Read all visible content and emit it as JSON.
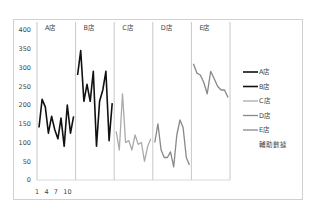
{
  "chart_data": {
    "type": "line",
    "title": "",
    "xlabel": "",
    "ylabel": "",
    "ylim": [
      0,
      400
    ],
    "yticks": [
      0,
      50,
      100,
      150,
      200,
      250,
      300,
      350,
      400
    ],
    "xtick_labels": [
      "1",
      "4",
      "7",
      "10"
    ],
    "panel_labels": [
      "A店",
      "B店",
      "C店",
      "D店",
      "E店"
    ],
    "grid": false,
    "legend_position": "right",
    "legend": [
      "A店",
      "B店",
      "C店",
      "D店",
      "E店",
      "輔助數據"
    ],
    "series": [
      {
        "name": "A店",
        "color": "#111111",
        "width": 1.6,
        "values": [
          140,
          215,
          195,
          125,
          170,
          135,
          110,
          165,
          90,
          200,
          125,
          170
        ]
      },
      {
        "name": "B店",
        "color": "#111111",
        "width": 1.6,
        "values": [
          280,
          345,
          210,
          255,
          210,
          290,
          90,
          210,
          240,
          290,
          105,
          205
        ]
      },
      {
        "name": "C店",
        "color": "#aaaaaa",
        "width": 1.3,
        "values": [
          130,
          80,
          230,
          100,
          105,
          80,
          120,
          95,
          100,
          50,
          90,
          110
        ]
      },
      {
        "name": "D店",
        "color": "#888888",
        "width": 1.3,
        "values": [
          100,
          150,
          80,
          60,
          60,
          75,
          35,
          120,
          160,
          140,
          60,
          40
        ]
      },
      {
        "name": "E店",
        "color": "#888888",
        "width": 1.3,
        "values": [
          310,
          285,
          280,
          260,
          230,
          290,
          270,
          250,
          240,
          240,
          220
        ]
      },
      {
        "name": "輔助數據",
        "color": "#cccccc",
        "width": 1,
        "values": []
      }
    ]
  }
}
